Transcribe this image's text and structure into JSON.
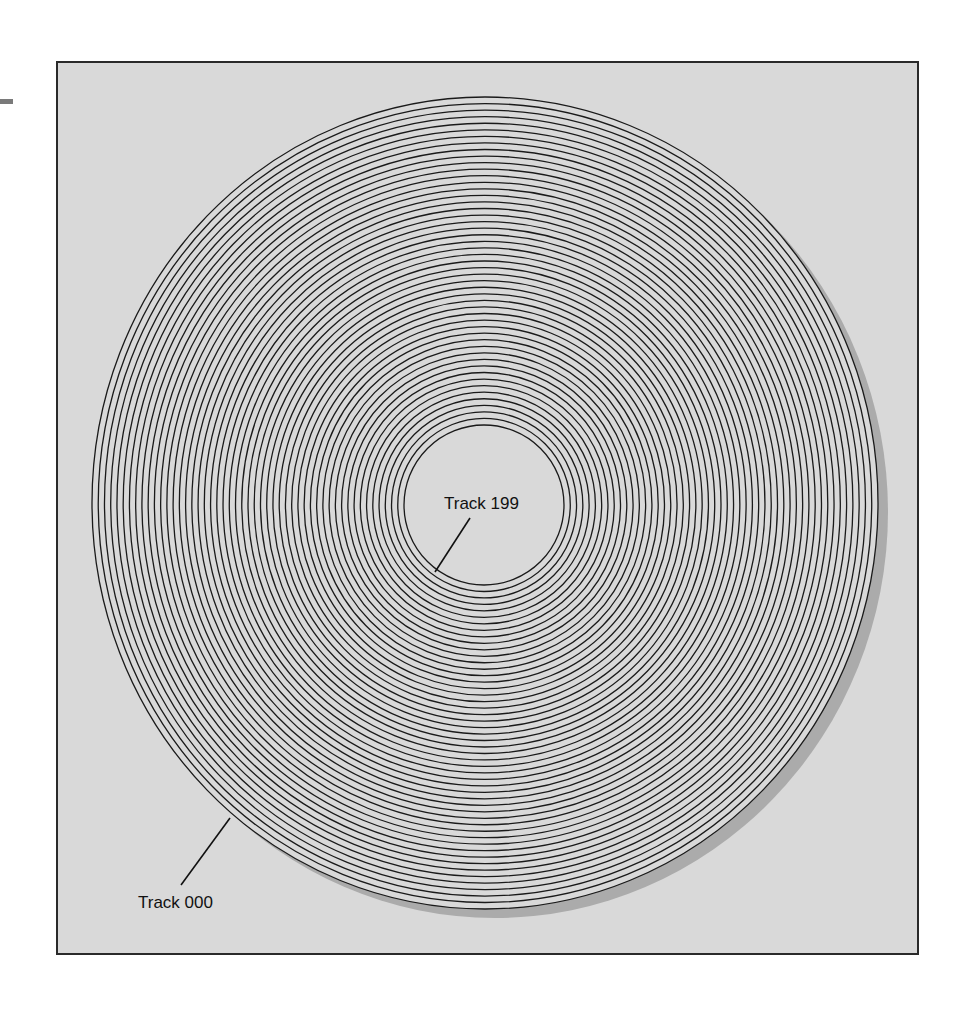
{
  "figure": {
    "background_color": "#d9d9d9",
    "frame_border_color": "#2a2a2a",
    "shadow_color": "#ababab",
    "ring_color": "#1a1a1a",
    "ring_count": 51,
    "outer_radius": {
      "rx": 393,
      "ry": 406
    },
    "inner_radius": {
      "rx": 80,
      "ry": 80
    },
    "center": {
      "x": 485,
      "y": 504
    }
  },
  "labels": {
    "inner_track": "Track 199",
    "outer_track": "Track 000"
  }
}
